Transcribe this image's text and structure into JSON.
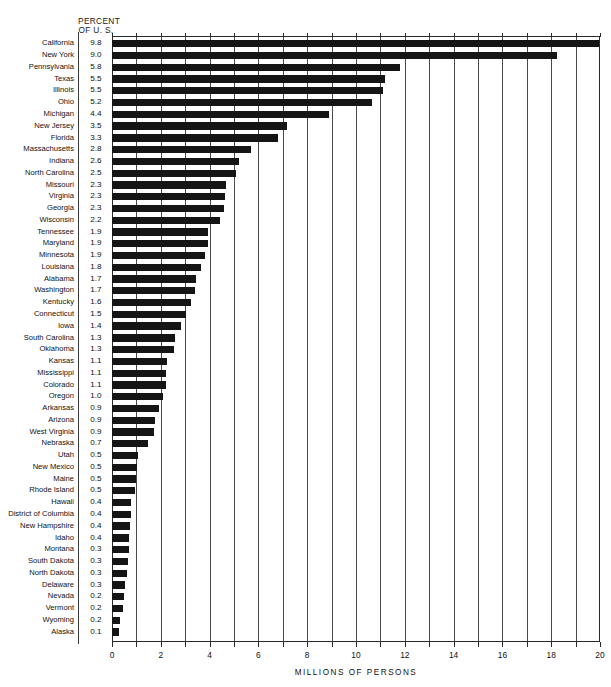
{
  "header": {
    "percent_line1": "PERCENT",
    "percent_line2": "OF U. S."
  },
  "axis": {
    "xlabel": "MILLIONS OF PERSONS",
    "ticks": [
      "0",
      "2",
      "4",
      "6",
      "8",
      "10",
      "12",
      "14",
      "16",
      "18",
      "20"
    ],
    "xmin": 0,
    "xmax": 20,
    "gridline_step": 1
  },
  "chart_data": {
    "type": "bar",
    "orientation": "horizontal",
    "title": "",
    "xlabel": "MILLIONS OF PERSONS",
    "ylabel": "",
    "xlim": [
      0,
      20
    ],
    "grid": true,
    "legend": null,
    "value_column_header": "PERCENT OF U. S.",
    "categories": [
      "California",
      "New York",
      "Pennsylvania",
      "Texas",
      "Illinois",
      "Ohio",
      "Michigan",
      "New Jersey",
      "Florida",
      "Massachusetts",
      "Indiana",
      "North Carolina",
      "Missouri",
      "Virginia",
      "Georgia",
      "Wisconsin",
      "Tennessee",
      "Maryland",
      "Minnesota",
      "Louisiana",
      "Alabama",
      "Washington",
      "Kentucky",
      "Connecticut",
      "Iowa",
      "South Carolina",
      "Oklahoma",
      "Kansas",
      "Mississippi",
      "Colorado",
      "Oregon",
      "Arkansas",
      "Arizona",
      "West Virginia",
      "Nebraska",
      "Utah",
      "New Mexico",
      "Maine",
      "Rhode Island",
      "Hawaii",
      "District of Columbia",
      "New Hampshire",
      "Idaho",
      "Montana",
      "South Dakota",
      "North Dakota",
      "Delaware",
      "Nevada",
      "Vermont",
      "Wyoming",
      "Alaska"
    ],
    "percent_of_us": [
      "9.8",
      "9.0",
      "5.8",
      "5.5",
      "5.5",
      "5.2",
      "4.4",
      "3.5",
      "3.3",
      "2.8",
      "2.6",
      "2.5",
      "2.3",
      "2.3",
      "2.3",
      "2.2",
      "1.9",
      "1.9",
      "1.9",
      "1.8",
      "1.7",
      "1.7",
      "1.6",
      "1.5",
      "1.4",
      "1.3",
      "1.3",
      "1.1",
      "1.1",
      "1.1",
      "1.0",
      "0.9",
      "0.9",
      "0.9",
      "0.7",
      "0.5",
      "0.5",
      "0.5",
      "0.5",
      "0.4",
      "0.4",
      "0.4",
      "0.4",
      "0.3",
      "0.3",
      "0.3",
      "0.3",
      "0.2",
      "0.2",
      "0.2",
      "0.1"
    ],
    "values_millions": [
      19.95,
      18.24,
      11.79,
      11.2,
      11.11,
      10.65,
      8.88,
      7.17,
      6.79,
      5.69,
      5.19,
      5.08,
      4.68,
      4.65,
      4.59,
      4.42,
      3.92,
      3.92,
      3.8,
      3.64,
      3.44,
      3.41,
      3.22,
      3.03,
      2.82,
      2.59,
      2.56,
      2.25,
      2.22,
      2.21,
      2.09,
      1.92,
      1.77,
      1.74,
      1.48,
      1.06,
      1.02,
      0.99,
      0.95,
      0.77,
      0.76,
      0.74,
      0.71,
      0.69,
      0.67,
      0.62,
      0.55,
      0.49,
      0.44,
      0.33,
      0.3
    ]
  },
  "style": {
    "bar_color": "#151515",
    "grid_color": "#4a4a4a",
    "frame_color": "#2a2a2a",
    "background": "#ffffff"
  }
}
